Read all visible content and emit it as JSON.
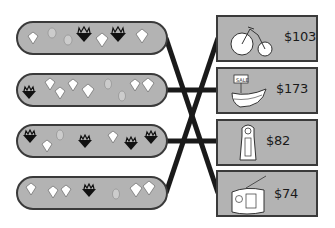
{
  "game": {
    "type": "matching",
    "instruction_visible": false
  },
  "gem_rows": [
    {
      "id": "row-1",
      "gems": [
        "diamond",
        "ruby",
        "ruby",
        "crown-black",
        "diamond",
        "crown-black",
        "diamond"
      ]
    },
    {
      "id": "row-2",
      "gems": [
        "crown-black",
        "diamond",
        "diamond",
        "diamond",
        "diamond",
        "ruby",
        "ruby",
        "diamond",
        "diamond"
      ]
    },
    {
      "id": "row-3",
      "gems": [
        "crown-black",
        "diamond",
        "ruby",
        "crown-black",
        "diamond",
        "crown-black",
        "crown-black"
      ]
    },
    {
      "id": "row-4",
      "gems": [
        "diamond",
        "diamond",
        "diamond",
        "crown-black",
        "ruby",
        "diamond",
        "diamond"
      ]
    }
  ],
  "items": [
    {
      "id": "bicycle",
      "icon": "bicycle-icon",
      "price": "$103"
    },
    {
      "id": "boat",
      "icon": "boat-icon",
      "sign": "SALE",
      "price": "$173"
    },
    {
      "id": "clock",
      "icon": "grandfather-clock-icon",
      "price": "$82"
    },
    {
      "id": "radio",
      "icon": "radio-icon",
      "price": "$74"
    }
  ],
  "connections": [
    {
      "from": "row-1",
      "to": "radio"
    },
    {
      "from": "row-2",
      "to": "boat"
    },
    {
      "from": "row-3",
      "to": "clock"
    },
    {
      "from": "row-4",
      "to": "bicycle"
    }
  ],
  "colors": {
    "panel": "#b3b3b3",
    "border": "#3a3a3a",
    "line": "#1a1a1a"
  }
}
